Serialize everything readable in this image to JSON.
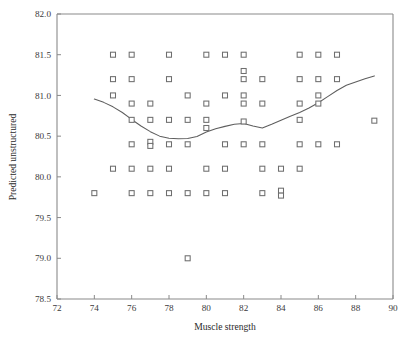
{
  "chart_data": {
    "type": "scatter",
    "title": "",
    "xlabel": "Muscle strength",
    "ylabel": "Predicted unstructured",
    "xlim": [
      72,
      90
    ],
    "ylim": [
      78.5,
      82.0
    ],
    "xticks": [
      72,
      74,
      76,
      78,
      80,
      82,
      84,
      86,
      88,
      90
    ],
    "xtick_labels": [
      "72",
      "74",
      "76",
      "78",
      "80",
      "82",
      "84",
      "86",
      "88",
      "90"
    ],
    "yticks": [
      78.5,
      79.0,
      79.5,
      80.0,
      80.5,
      81.0,
      81.5,
      82.0
    ],
    "ytick_labels": [
      "78.5",
      "79.0",
      "79.5",
      "80.0",
      "80.5",
      "81.0",
      "81.5",
      "82.0"
    ],
    "grid": false,
    "legend": "none",
    "marker_style": "open-square",
    "marker_color": "#6e6e6e",
    "curve_color": "#5e5e5e",
    "points": [
      [
        75,
        81.5
      ],
      [
        76,
        81.5
      ],
      [
        78,
        81.5
      ],
      [
        80,
        81.5
      ],
      [
        81,
        81.5
      ],
      [
        82,
        81.5
      ],
      [
        85,
        81.5
      ],
      [
        86,
        81.5
      ],
      [
        87,
        81.5
      ],
      [
        82,
        81.3
      ],
      [
        75,
        81.2
      ],
      [
        76,
        81.2
      ],
      [
        78,
        81.2
      ],
      [
        82,
        81.2
      ],
      [
        83,
        81.2
      ],
      [
        85,
        81.2
      ],
      [
        86,
        81.2
      ],
      [
        87,
        81.2
      ],
      [
        75,
        81.0
      ],
      [
        79,
        81.0
      ],
      [
        81,
        81.0
      ],
      [
        82,
        81.0
      ],
      [
        86,
        81.0
      ],
      [
        76,
        80.9
      ],
      [
        77,
        80.9
      ],
      [
        80,
        80.9
      ],
      [
        82,
        80.9
      ],
      [
        83,
        80.9
      ],
      [
        85,
        80.9
      ],
      [
        86,
        80.9
      ],
      [
        76,
        80.7
      ],
      [
        77,
        80.7
      ],
      [
        78,
        80.7
      ],
      [
        79,
        80.7
      ],
      [
        80,
        80.7
      ],
      [
        82,
        80.68
      ],
      [
        85,
        80.7
      ],
      [
        89,
        80.69
      ],
      [
        80,
        80.6
      ],
      [
        76,
        80.4
      ],
      [
        77,
        80.43
      ],
      [
        77,
        80.38
      ],
      [
        78,
        80.4
      ],
      [
        79,
        80.4
      ],
      [
        81,
        80.4
      ],
      [
        82,
        80.4
      ],
      [
        83,
        80.4
      ],
      [
        85,
        80.4
      ],
      [
        86,
        80.4
      ],
      [
        87,
        80.4
      ],
      [
        75,
        80.1
      ],
      [
        76,
        80.1
      ],
      [
        77,
        80.1
      ],
      [
        78,
        80.1
      ],
      [
        80,
        80.1
      ],
      [
        81,
        80.1
      ],
      [
        83,
        80.1
      ],
      [
        84,
        80.1
      ],
      [
        85,
        80.1
      ],
      [
        74,
        79.8
      ],
      [
        76,
        79.8
      ],
      [
        77,
        79.8
      ],
      [
        78,
        79.8
      ],
      [
        79,
        79.8
      ],
      [
        80,
        79.8
      ],
      [
        81,
        79.8
      ],
      [
        83,
        79.8
      ],
      [
        84,
        79.83
      ],
      [
        84,
        79.77
      ],
      [
        79,
        79.0
      ]
    ],
    "fit_curve": [
      [
        74.0,
        80.955
      ],
      [
        74.5,
        80.915
      ],
      [
        75.0,
        80.86
      ],
      [
        75.5,
        80.79
      ],
      [
        76.0,
        80.705
      ],
      [
        76.5,
        80.625
      ],
      [
        77.0,
        80.555
      ],
      [
        77.5,
        80.5
      ],
      [
        78.0,
        80.475
      ],
      [
        78.5,
        80.468
      ],
      [
        79.0,
        80.47
      ],
      [
        79.5,
        80.495
      ],
      [
        80.0,
        80.55
      ],
      [
        80.5,
        80.59
      ],
      [
        81.0,
        80.62
      ],
      [
        81.5,
        80.645
      ],
      [
        82.0,
        80.655
      ],
      [
        82.5,
        80.625
      ],
      [
        83.0,
        80.6
      ],
      [
        83.5,
        80.645
      ],
      [
        84.0,
        80.695
      ],
      [
        84.5,
        80.745
      ],
      [
        85.0,
        80.79
      ],
      [
        85.5,
        80.845
      ],
      [
        86.0,
        80.91
      ],
      [
        86.5,
        80.985
      ],
      [
        87.0,
        81.06
      ],
      [
        87.5,
        81.125
      ],
      [
        88.0,
        81.165
      ],
      [
        88.5,
        81.205
      ],
      [
        89.0,
        81.24
      ]
    ]
  },
  "figure": {
    "caption": ""
  }
}
